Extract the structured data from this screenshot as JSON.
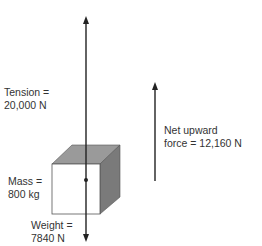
{
  "diagram": {
    "tension_label": [
      "Tension =",
      "20,000 N"
    ],
    "mass_label": [
      "Mass =",
      "800 kg"
    ],
    "weight_label": [
      "Weight =",
      "7840 N"
    ],
    "net_force_label": [
      "Net upward",
      "force = 12,160 N"
    ]
  },
  "colors": {
    "line": "#222222",
    "cube_top": "#9a9a9a",
    "cube_side": "#7a7a7a",
    "cube_front": "#ffffff"
  }
}
